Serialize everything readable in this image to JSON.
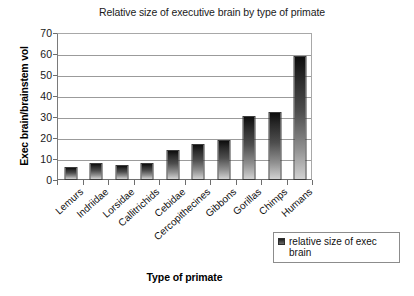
{
  "chart_data": {
    "type": "bar",
    "title": "Relative size of executive brain by type of primate",
    "xlabel": "Type of primate",
    "ylabel": "Exec brain/brainstem vol",
    "ylim": [
      0,
      70
    ],
    "ytick_step": 10,
    "grid": true,
    "legend_position": "bottom-right",
    "categories": [
      "Lemurs",
      "Indriidae",
      "Lorsidae",
      "Callitrichids",
      "Cebidae",
      "Cercopithecines",
      "Gibbons",
      "Gorillas",
      "Chimps",
      "Humans"
    ],
    "yticks": [
      "0",
      "10",
      "20",
      "30",
      "40",
      "50",
      "60",
      "70"
    ],
    "series": [
      {
        "name": "relative size of exec brain",
        "values": [
          6,
          8,
          7,
          8,
          14.5,
          17,
          19,
          30.5,
          32.5,
          59
        ]
      }
    ],
    "bar_color_top": "#0d0d0d",
    "bar_color_bottom": "#d2d2d2"
  },
  "legend": {
    "entries": [
      {
        "label": "relative size of exec brain",
        "marker": "filled-square-marker"
      }
    ]
  }
}
